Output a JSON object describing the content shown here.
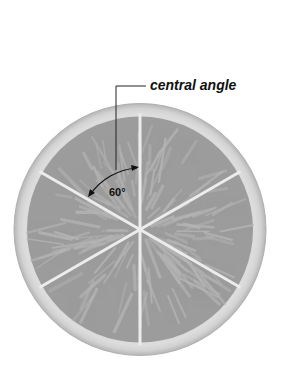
{
  "diagram": {
    "callout_label": "central angle",
    "angle_label": "60°",
    "segments": 6,
    "segment_angle_degrees": 60,
    "colors": {
      "background": "#ffffff",
      "rind_outer": "#bdbdbd",
      "rind_inner": "#e4e4e4",
      "pulp": "#9c9c9c",
      "vein": "#b4b4b4",
      "separator": "#ececec",
      "line": "#222222"
    }
  }
}
